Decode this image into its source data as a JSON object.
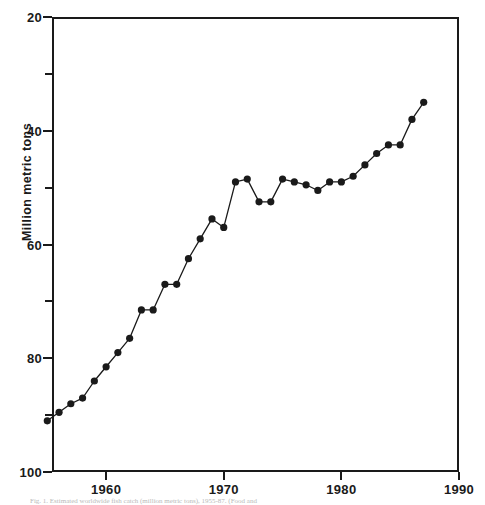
{
  "figure": {
    "background_color": "#ffffff",
    "ink_color": "#1a1a1a"
  },
  "axes": {
    "y_title": "Million metric tons",
    "y_major_labels": [
      "100",
      "80",
      "60",
      "40",
      "20"
    ],
    "x_major_labels": [
      "1960",
      "1970",
      "1980",
      "1990"
    ]
  },
  "caption": {
    "text": "Fig. 1.  Estimated worldwide fish catch (million metric tons), 1955-87. (Food and"
  },
  "chart_data": {
    "type": "line",
    "title": "",
    "subtitle": "",
    "xlabel": "",
    "ylabel": "Million metric tons",
    "xlim": [
      1955.4,
      1990
    ],
    "ylim": [
      20,
      100
    ],
    "xticks": [
      1960,
      1970,
      1980,
      1990
    ],
    "yticks": [
      20,
      40,
      60,
      80,
      100
    ],
    "y_minor_ticks": [
      30,
      50,
      70,
      90
    ],
    "grid": false,
    "legend": null,
    "markers": "filled-circle",
    "marker_color": "#1a1a1a",
    "line_color": "#1a1a1a",
    "x": [
      1955,
      1956,
      1957,
      1958,
      1959,
      1960,
      1961,
      1962,
      1963,
      1964,
      1965,
      1966,
      1967,
      1968,
      1969,
      1970,
      1971,
      1972,
      1973,
      1974,
      1975,
      1976,
      1977,
      1978,
      1979,
      1980,
      1981,
      1982,
      1983,
      1984,
      1985,
      1986,
      1987
    ],
    "values": [
      29.0,
      30.5,
      32.0,
      33.0,
      36.0,
      38.5,
      41.0,
      43.5,
      48.5,
      48.5,
      53.0,
      53.0,
      57.5,
      61.0,
      64.5,
      63.0,
      71.0,
      71.5,
      67.5,
      67.5,
      71.5,
      71.0,
      70.5,
      69.5,
      71.0,
      71.0,
      72.0,
      74.0,
      76.0,
      77.5,
      77.5,
      82.0,
      85.0
    ],
    "series": [
      {
        "name": "World fish catch",
        "values": [
          29.0,
          30.5,
          32.0,
          33.0,
          36.0,
          38.5,
          41.0,
          43.5,
          48.5,
          48.5,
          53.0,
          53.0,
          57.5,
          61.0,
          64.5,
          63.0,
          71.0,
          71.5,
          67.5,
          67.5,
          71.5,
          71.0,
          70.5,
          69.5,
          71.0,
          71.0,
          72.0,
          74.0,
          76.0,
          77.5,
          77.5,
          82.0,
          85.0
        ]
      }
    ]
  }
}
